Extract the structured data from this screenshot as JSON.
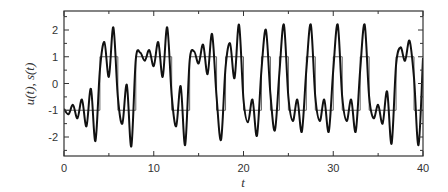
{
  "chart_data": {
    "type": "line",
    "title": "",
    "xlabel": "t",
    "ylabel": "u(t), s(t)",
    "xlim": [
      0,
      40
    ],
    "ylim": [
      -2.6,
      2.8
    ],
    "x_ticks": [
      0,
      10,
      20,
      30,
      40
    ],
    "x_tick_labels": [
      "0",
      "10",
      "20",
      "30",
      "40"
    ],
    "y_ticks": [
      -2,
      -1,
      0,
      1,
      2
    ],
    "y_tick_labels": [
      "-2",
      "-1",
      "0",
      "1",
      "2"
    ],
    "grid": false,
    "legend": null,
    "series": [
      {
        "name": "u(t)",
        "style": "step",
        "color": "#555555",
        "transitions": [
          {
            "t": 0,
            "value": -1
          },
          {
            "t": 4,
            "value": 1
          },
          {
            "t": 6,
            "value": -1
          },
          {
            "t": 8,
            "value": 1
          },
          {
            "t": 12,
            "value": -1
          },
          {
            "t": 14,
            "value": 1
          },
          {
            "t": 17,
            "value": -1
          },
          {
            "t": 18,
            "value": 1
          },
          {
            "t": 20,
            "value": -1
          },
          {
            "t": 22,
            "value": 1
          },
          {
            "t": 23,
            "value": -1
          },
          {
            "t": 24,
            "value": 1
          },
          {
            "t": 25,
            "value": -1
          },
          {
            "t": 27,
            "value": 1
          },
          {
            "t": 28,
            "value": -1
          },
          {
            "t": 30,
            "value": 1
          },
          {
            "t": 31,
            "value": -1
          },
          {
            "t": 33,
            "value": 1
          },
          {
            "t": 34,
            "value": -1
          },
          {
            "t": 37,
            "value": 1
          },
          {
            "t": 39,
            "value": -1
          },
          {
            "t": 40,
            "value": -1
          }
        ]
      },
      {
        "name": "s(t)",
        "style": "line",
        "color": "#111111",
        "description": "Oscillatory (damped ringing) response following the square wave u(t); peaks reach about ±2.1 to ±2.3 shortly after each switch",
        "peak_samples": [
          {
            "t": 0.0,
            "y": -0.95
          },
          {
            "t": 0.5,
            "y": -1.15
          },
          {
            "t": 1.0,
            "y": -0.8
          },
          {
            "t": 1.5,
            "y": -1.3
          },
          {
            "t": 2.0,
            "y": -0.6
          },
          {
            "t": 2.5,
            "y": -1.6
          },
          {
            "t": 3.0,
            "y": -0.2
          },
          {
            "t": 3.5,
            "y": -2.15
          },
          {
            "t": 4.0,
            "y": 0.5
          },
          {
            "t": 4.5,
            "y": 1.55
          },
          {
            "t": 5.0,
            "y": 0.25
          },
          {
            "t": 5.5,
            "y": 2.1
          },
          {
            "t": 6.0,
            "y": -0.5
          },
          {
            "t": 6.5,
            "y": -1.5
          },
          {
            "t": 7.0,
            "y": -0.05
          },
          {
            "t": 7.5,
            "y": -2.35
          },
          {
            "t": 8.0,
            "y": 0.9
          },
          {
            "t": 8.5,
            "y": 1.15
          },
          {
            "t": 9.0,
            "y": 0.85
          },
          {
            "t": 9.5,
            "y": 1.25
          },
          {
            "t": 10.0,
            "y": 0.65
          },
          {
            "t": 10.5,
            "y": 1.55
          },
          {
            "t": 11.0,
            "y": 0.25
          },
          {
            "t": 11.5,
            "y": 2.1
          },
          {
            "t": 12.0,
            "y": -0.45
          },
          {
            "t": 12.5,
            "y": -1.6
          },
          {
            "t": 13.0,
            "y": -0.1
          },
          {
            "t": 13.5,
            "y": -2.3
          },
          {
            "t": 14.0,
            "y": 0.85
          },
          {
            "t": 14.5,
            "y": 1.2
          },
          {
            "t": 15.0,
            "y": 0.75
          },
          {
            "t": 15.5,
            "y": 1.45
          },
          {
            "t": 16.0,
            "y": 0.35
          },
          {
            "t": 16.5,
            "y": 1.85
          },
          {
            "t": 17.0,
            "y": -0.5
          },
          {
            "t": 17.5,
            "y": -2.1
          },
          {
            "t": 18.0,
            "y": 0.6
          },
          {
            "t": 18.5,
            "y": 1.5
          },
          {
            "t": 19.0,
            "y": 0.2
          },
          {
            "t": 19.5,
            "y": 2.2
          },
          {
            "t": 20.0,
            "y": -0.6
          },
          {
            "t": 20.5,
            "y": -1.45
          },
          {
            "t": 21.0,
            "y": -0.6
          },
          {
            "t": 21.5,
            "y": -1.95
          },
          {
            "t": 22.0,
            "y": 0.5
          },
          {
            "t": 22.5,
            "y": 2.0
          },
          {
            "t": 23.0,
            "y": -0.4
          },
          {
            "t": 23.5,
            "y": -1.75
          },
          {
            "t": 24.0,
            "y": 0.4
          },
          {
            "t": 24.5,
            "y": 2.2
          },
          {
            "t": 25.0,
            "y": -0.5
          },
          {
            "t": 25.5,
            "y": -1.4
          },
          {
            "t": 26.0,
            "y": -0.6
          },
          {
            "t": 26.5,
            "y": -1.8
          },
          {
            "t": 27.0,
            "y": 0.5
          },
          {
            "t": 27.5,
            "y": 2.2
          },
          {
            "t": 28.0,
            "y": -0.5
          },
          {
            "t": 28.5,
            "y": -1.4
          },
          {
            "t": 29.0,
            "y": -0.6
          },
          {
            "t": 29.5,
            "y": -1.8
          },
          {
            "t": 30.0,
            "y": 0.5
          },
          {
            "t": 30.5,
            "y": 2.2
          },
          {
            "t": 31.0,
            "y": -0.5
          },
          {
            "t": 31.5,
            "y": -1.4
          },
          {
            "t": 32.0,
            "y": -0.6
          },
          {
            "t": 32.5,
            "y": -1.8
          },
          {
            "t": 33.0,
            "y": 0.5
          },
          {
            "t": 33.5,
            "y": 2.2
          },
          {
            "t": 34.0,
            "y": -0.5
          },
          {
            "t": 34.5,
            "y": -1.3
          },
          {
            "t": 35.0,
            "y": -0.8
          },
          {
            "t": 35.5,
            "y": -1.5
          },
          {
            "t": 36.0,
            "y": -0.3
          },
          {
            "t": 36.5,
            "y": -2.25
          },
          {
            "t": 37.0,
            "y": 0.7
          },
          {
            "t": 37.5,
            "y": 1.35
          },
          {
            "t": 38.0,
            "y": 0.85
          },
          {
            "t": 38.5,
            "y": 1.6
          },
          {
            "t": 39.0,
            "y": 0.2
          },
          {
            "t": 39.5,
            "y": -2.3
          },
          {
            "t": 40.0,
            "y": 0.95
          }
        ]
      }
    ]
  }
}
